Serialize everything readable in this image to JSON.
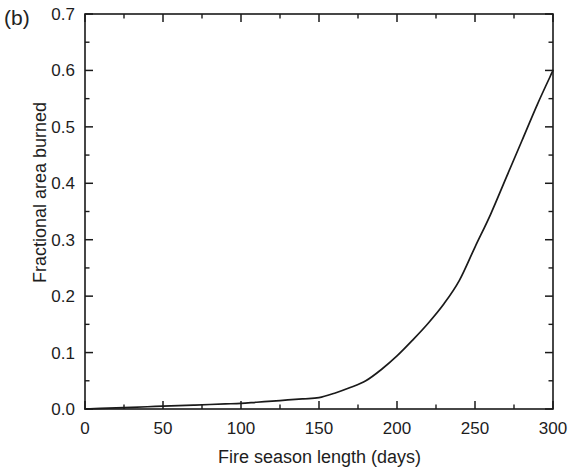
{
  "figure": {
    "panel_label": "(b)",
    "background_color": "#ffffff",
    "line_color": "#1a1a1a",
    "axis_color": "#1a1a1a"
  },
  "chart_data": {
    "type": "line",
    "title": "",
    "subtitle": "",
    "panel": "(b)",
    "xlabel": "Fire season length (days)",
    "ylabel": "Fractional area burned",
    "xlim": [
      0,
      300
    ],
    "ylim": [
      0.0,
      0.7
    ],
    "grid": false,
    "legend": null,
    "x_major_ticks": [
      0,
      50,
      100,
      150,
      200,
      250,
      300
    ],
    "x_major_tick_labels": [
      "0",
      "50",
      "100",
      "150",
      "200",
      "250",
      "300"
    ],
    "x_minor_ticks": [
      25,
      75,
      125,
      175,
      225,
      275
    ],
    "y_major_ticks": [
      0.0,
      0.1,
      0.2,
      0.3,
      0.4,
      0.5,
      0.6,
      0.7
    ],
    "y_major_tick_labels": [
      "0.0",
      "0.1",
      "0.2",
      "0.3",
      "0.4",
      "0.5",
      "0.6",
      "0.7"
    ],
    "y_minor_ticks": [
      0.05,
      0.15,
      0.25,
      0.35,
      0.45,
      0.55,
      0.65
    ],
    "series": [
      {
        "name": "Fractional area burned",
        "x": [
          0,
          10,
          20,
          30,
          40,
          50,
          60,
          70,
          80,
          90,
          100,
          110,
          120,
          130,
          140,
          150,
          160,
          170,
          180,
          190,
          200,
          210,
          220,
          230,
          240,
          250,
          260,
          270,
          280,
          290,
          300
        ],
        "values": [
          0.0,
          0.001,
          0.002,
          0.003,
          0.004,
          0.005,
          0.006,
          0.007,
          0.008,
          0.009,
          0.01,
          0.012,
          0.014,
          0.016,
          0.018,
          0.02,
          0.028,
          0.038,
          0.05,
          0.07,
          0.094,
          0.122,
          0.152,
          0.186,
          0.228,
          0.287,
          0.345,
          0.41,
          0.475,
          0.54,
          0.6
        ]
      }
    ]
  }
}
